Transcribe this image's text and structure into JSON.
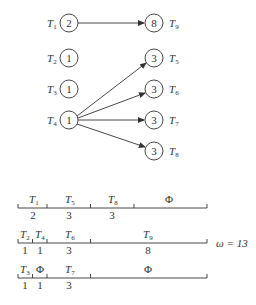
{
  "diagram": {
    "nodes_left": [
      {
        "id": "T1",
        "name": "T",
        "sub": "1",
        "weight": "2",
        "cx": 69,
        "cy": 23
      },
      {
        "id": "T2",
        "name": "T",
        "sub": "2",
        "weight": "1",
        "cx": 69,
        "cy": 58
      },
      {
        "id": "T3",
        "name": "T",
        "sub": "3",
        "weight": "1",
        "cx": 69,
        "cy": 89
      },
      {
        "id": "T4",
        "name": "T",
        "sub": "4",
        "weight": "1",
        "cx": 69,
        "cy": 120
      }
    ],
    "nodes_right": [
      {
        "id": "T9",
        "name": "T",
        "sub": "9",
        "weight": "8",
        "cx": 154,
        "cy": 23
      },
      {
        "id": "T5",
        "name": "T",
        "sub": "5",
        "weight": "3",
        "cx": 154,
        "cy": 58
      },
      {
        "id": "T6",
        "name": "T",
        "sub": "6",
        "weight": "3",
        "cx": 154,
        "cy": 89
      },
      {
        "id": "T7",
        "name": "T",
        "sub": "7",
        "weight": "3",
        "cx": 154,
        "cy": 120
      },
      {
        "id": "T8",
        "name": "T",
        "sub": "8",
        "weight": "3",
        "cx": 154,
        "cy": 151
      }
    ],
    "edges": [
      {
        "from": "T1",
        "to": "T9"
      },
      {
        "from": "T4",
        "to": "T5"
      },
      {
        "from": "T4",
        "to": "T6"
      },
      {
        "from": "T4",
        "to": "T7"
      },
      {
        "from": "T4",
        "to": "T8"
      }
    ]
  },
  "schedule": {
    "omega_label": "ω = 13",
    "total_units": 13,
    "rows": [
      {
        "segments": [
          {
            "label": "T",
            "sub": "1",
            "duration": "2"
          },
          {
            "label": "T",
            "sub": "5",
            "duration": "3"
          },
          {
            "label": "T",
            "sub": "8",
            "duration": "3"
          },
          {
            "label": "Φ",
            "sub": "",
            "duration": ""
          }
        ]
      },
      {
        "segments": [
          {
            "label": "T",
            "sub": "2",
            "duration": "1"
          },
          {
            "label": "T",
            "sub": "4",
            "duration": "1"
          },
          {
            "label": "T",
            "sub": "6",
            "duration": "3"
          },
          {
            "label": "T",
            "sub": "9",
            "duration": "8"
          }
        ]
      },
      {
        "segments": [
          {
            "label": "T",
            "sub": "3",
            "duration": "1"
          },
          {
            "label": "Φ",
            "sub": "",
            "duration": "1"
          },
          {
            "label": "T",
            "sub": "7",
            "duration": "3"
          },
          {
            "label": "Φ",
            "sub": "",
            "duration": ""
          }
        ]
      }
    ]
  }
}
